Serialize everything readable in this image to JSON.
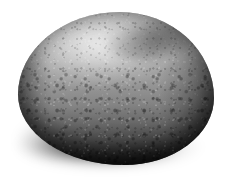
{
  "image": {
    "subject": "rock",
    "description": "Grayscale photograph of a single rounded boulder, potato-shaped, isolated on a plain white background",
    "orientation": "landscape",
    "background_color": "#ffffff",
    "palette": {
      "highlight": "#c4c4c4",
      "upper_body": "#b4b4b4",
      "mid_body": "#9a9a9a",
      "lower_body": "#686868",
      "base_dark": "#2b2b2b",
      "silhouette": "#141414",
      "shadow": "#000000"
    },
    "lighting": {
      "direction": "upper-left",
      "highlight_region": "top surface, left of center",
      "terminator": "lower-right rim"
    },
    "surface": {
      "texture": "fine granular speckle with coarser pitting on the lower half",
      "features": [
        "broad lit dome across the top",
        "darker ridge band along the upper-right shoulder",
        "dark terminator along the right flank",
        "heavily pitted, shadowed lower body",
        "soft diffuse contact shadow beneath the base"
      ]
    }
  }
}
